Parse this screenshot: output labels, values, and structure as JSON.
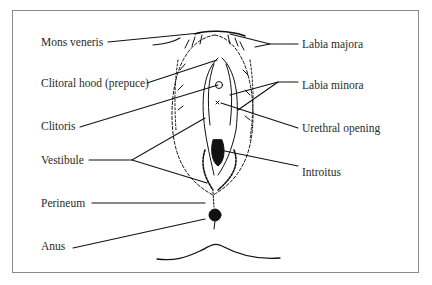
{
  "diagram": {
    "type": "labeled anatomical line drawing",
    "colors": {
      "line": "#111111",
      "text": "#2a2a2a",
      "frame": "#8a8a8a",
      "background": "#ffffff"
    },
    "labels_left": [
      {
        "id": "mons-veneris",
        "text": "Mons veneris",
        "x": 41,
        "y": 36
      },
      {
        "id": "clitoral-hood",
        "text": "Clitoral hood (prepuce)",
        "x": 41,
        "y": 77
      },
      {
        "id": "clitoris",
        "text": "Clitoris",
        "x": 41,
        "y": 120
      },
      {
        "id": "vestibule",
        "text": "Vestibule",
        "x": 41,
        "y": 154
      },
      {
        "id": "perineum",
        "text": "Perineum",
        "x": 41,
        "y": 197
      },
      {
        "id": "anus",
        "text": "Anus",
        "x": 41,
        "y": 240
      }
    ],
    "labels_right": [
      {
        "id": "labia-majora",
        "text": "Labia majora",
        "x": 302,
        "y": 38
      },
      {
        "id": "labia-minora",
        "text": "Labia minora",
        "x": 302,
        "y": 79
      },
      {
        "id": "urethral-opening",
        "text": "Urethral opening",
        "x": 302,
        "y": 122
      },
      {
        "id": "introitus",
        "text": "Introitus",
        "x": 302,
        "y": 166
      }
    ]
  }
}
